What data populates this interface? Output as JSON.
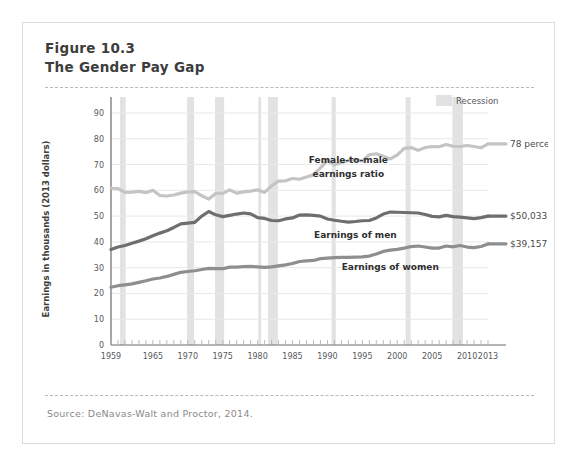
{
  "figure": {
    "number_line": "Figure 10.3",
    "title_line": "The Gender Pay Gap",
    "source": "Source: DeNavas-Walt and Proctor, 2014."
  },
  "legend": {
    "recession_label": "Recession",
    "recession_color": "#e2e2e2"
  },
  "annotations": {
    "ratio_end": "78 percent",
    "men_end": "$50,033",
    "women_end": "$39,157",
    "ratio_series_label_line1": "Female-to-male",
    "ratio_series_label_line2": "earnings ratio",
    "men_series_label": "Earnings of men",
    "women_series_label": "Earnings of women"
  },
  "chart_data": {
    "type": "line",
    "title": "The Gender Pay Gap",
    "xlabel": "",
    "ylabel": "Earnings in thousands (2013 dollars)",
    "xlim": [
      1959,
      2013
    ],
    "ylim": [
      0,
      90
    ],
    "ytick_step": 10,
    "yticks": [
      0,
      10,
      20,
      30,
      40,
      50,
      60,
      70,
      80,
      90
    ],
    "xticks": [
      1959,
      1965,
      1970,
      1975,
      1980,
      1985,
      1990,
      1995,
      2000,
      2005,
      2010,
      2013
    ],
    "minor_xtick_interval": 1,
    "grid": "horizontal",
    "legend_position": "top-right",
    "colors": {
      "men": "#6e6e6e",
      "women": "#8e8e8e",
      "ratio": "#c4c4c4",
      "grid": "#e8e8e8",
      "axis": "#6b6b6b"
    },
    "x": [
      1959,
      1960,
      1961,
      1962,
      1963,
      1964,
      1965,
      1966,
      1967,
      1968,
      1969,
      1970,
      1971,
      1972,
      1973,
      1974,
      1975,
      1976,
      1977,
      1978,
      1979,
      1980,
      1981,
      1982,
      1983,
      1984,
      1985,
      1986,
      1987,
      1988,
      1989,
      1990,
      1991,
      1992,
      1993,
      1994,
      1995,
      1996,
      1997,
      1998,
      1999,
      2000,
      2001,
      2002,
      2003,
      2004,
      2005,
      2006,
      2007,
      2008,
      2009,
      2010,
      2011,
      2012,
      2013
    ],
    "series": [
      {
        "name": "Earnings of men",
        "unit": "thousands of 2013 dollars",
        "color": "#6e6e6e",
        "values": [
          37.0,
          38.0,
          38.6,
          39.5,
          40.3,
          41.2,
          42.4,
          43.4,
          44.3,
          45.6,
          47.0,
          47.3,
          47.6,
          50.0,
          51.8,
          50.5,
          49.8,
          50.3,
          50.8,
          51.2,
          50.9,
          49.4,
          49.1,
          48.3,
          48.2,
          48.9,
          49.3,
          50.4,
          50.5,
          50.3,
          50.0,
          48.9,
          48.4,
          48.0,
          47.7,
          47.9,
          48.2,
          48.3,
          49.3,
          50.8,
          51.6,
          51.5,
          51.4,
          51.3,
          51.2,
          50.6,
          49.9,
          49.7,
          50.3,
          49.8,
          49.6,
          49.3,
          49.0,
          49.4,
          50.0
        ]
      },
      {
        "name": "Earnings of women",
        "unit": "thousands of 2013 dollars",
        "color": "#8e8e8e",
        "values": [
          22.4,
          23.0,
          23.3,
          23.7,
          24.3,
          24.9,
          25.6,
          26.0,
          26.6,
          27.4,
          28.2,
          28.5,
          28.8,
          29.3,
          29.7,
          29.6,
          29.6,
          30.2,
          30.2,
          30.4,
          30.5,
          30.3,
          30.1,
          30.3,
          30.7,
          31.1,
          31.6,
          32.4,
          32.6,
          32.8,
          33.5,
          33.7,
          33.9,
          34.0,
          34.0,
          34.1,
          34.2,
          34.5,
          35.3,
          36.3,
          36.8,
          37.1,
          37.6,
          38.2,
          38.4,
          38.0,
          37.6,
          37.6,
          38.4,
          38.1,
          38.6,
          38.0,
          37.8,
          38.2,
          39.2
        ]
      },
      {
        "name": "Female-to-male earnings ratio",
        "unit": "percent",
        "color": "#c4c4c4",
        "axis": "percent (plotted on same 0-90 scale)",
        "values": [
          60.8,
          60.7,
          59.2,
          59.3,
          59.6,
          59.1,
          60.0,
          58.0,
          57.8,
          58.2,
          58.9,
          59.4,
          59.5,
          57.9,
          56.6,
          58.8,
          58.8,
          60.2,
          58.9,
          59.4,
          59.7,
          60.2,
          59.2,
          61.7,
          63.6,
          63.7,
          64.6,
          64.3,
          65.2,
          66.0,
          68.7,
          71.6,
          69.9,
          70.8,
          71.5,
          72.0,
          71.4,
          73.8,
          74.2,
          73.2,
          72.2,
          73.7,
          76.3,
          76.6,
          75.5,
          76.6,
          77.0,
          76.9,
          77.8,
          77.1,
          77.0,
          77.4,
          77.0,
          76.5,
          78.0
        ]
      }
    ],
    "recessions": [
      {
        "start": 1960.3,
        "end": 1961.1
      },
      {
        "start": 1969.9,
        "end": 1970.9
      },
      {
        "start": 1973.9,
        "end": 1975.2
      },
      {
        "start": 1980.1,
        "end": 1980.5
      },
      {
        "start": 1981.5,
        "end": 1982.9
      },
      {
        "start": 1990.6,
        "end": 1991.2
      },
      {
        "start": 2001.2,
        "end": 2001.9
      },
      {
        "start": 2007.9,
        "end": 2009.4
      }
    ]
  }
}
